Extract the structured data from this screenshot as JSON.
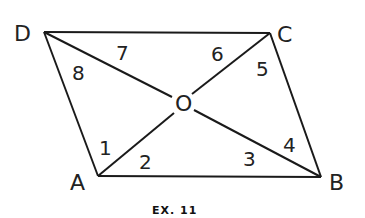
{
  "figure": {
    "caption": "EX. 11",
    "shape": "parallelogram",
    "vertices": {
      "D": {
        "label": "D",
        "x": 44,
        "y": 32
      },
      "C": {
        "label": "C",
        "x": 270,
        "y": 33
      },
      "A": {
        "label": "A",
        "x": 98,
        "y": 176
      },
      "B": {
        "label": "B",
        "x": 321,
        "y": 177
      }
    },
    "center": {
      "label": "O",
      "x": 183,
      "y": 103
    },
    "angles": [
      "1",
      "2",
      "3",
      "4",
      "5",
      "6",
      "7",
      "8"
    ]
  }
}
